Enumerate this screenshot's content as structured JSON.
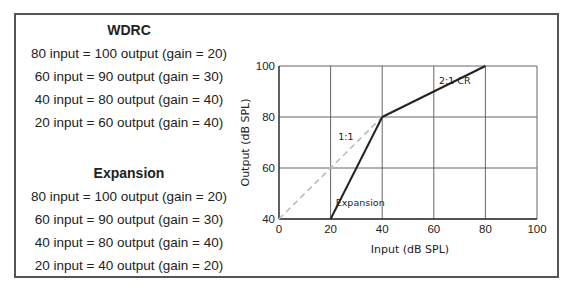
{
  "panel": {
    "wdrc": {
      "title": "WDRC",
      "lines": [
        "80 input = 100 output (gain = 20)",
        "60 input = 90 output (gain = 30)",
        "40 input = 80 output (gain = 40)",
        "20 input = 60 output (gain = 40)"
      ]
    },
    "expansion": {
      "title": "Expansion",
      "lines": [
        "80 input = 100 output (gain = 20)",
        "60 input = 90 output (gain = 30)",
        "40 input = 80 output (gain = 40)",
        "20 input = 40 output (gain = 20)"
      ]
    }
  },
  "chart_data": {
    "type": "line",
    "title": "",
    "xlabel": "Input (dB SPL)",
    "ylabel": "Output (dB SPL)",
    "xlim": [
      0,
      100
    ],
    "ylim": [
      40,
      100
    ],
    "xticks": [
      0,
      20,
      40,
      60,
      80,
      100
    ],
    "yticks": [
      40,
      60,
      80,
      100
    ],
    "grid": true,
    "series": [
      {
        "name": "1:1",
        "style": "dashed",
        "color": "#bbbbbb",
        "x": [
          0,
          40
        ],
        "y": [
          40,
          80
        ]
      },
      {
        "name": "Expansion",
        "style": "solid",
        "color": "#222222",
        "x": [
          20,
          40
        ],
        "y": [
          40,
          80
        ]
      },
      {
        "name": "2:1 CR",
        "style": "solid",
        "color": "#222222",
        "x": [
          40,
          80
        ],
        "y": [
          80,
          100
        ]
      }
    ],
    "annotations": [
      {
        "text": "1:1",
        "x": 23,
        "y": 71
      },
      {
        "text": "Expansion",
        "x": 22,
        "y": 45
      },
      {
        "text": "2:1 CR",
        "x": 62,
        "y": 93
      }
    ]
  }
}
